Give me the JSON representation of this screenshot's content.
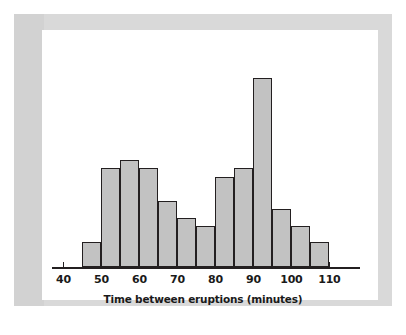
{
  "figure": {
    "background_color": "#ffffff",
    "mat_color": "#d9d9d9",
    "panel_color": "#ffffff",
    "bar_fill_color": "#c2c2c2",
    "bar_edge_color": "#231f20",
    "axis_color": "#231f20"
  },
  "chart_data": {
    "type": "bar",
    "title": "",
    "subtitle": "",
    "xlabel": "Time between eruptions (minutes)",
    "ylabel": "",
    "grid": false,
    "legend": null,
    "legend_position": "none",
    "bin_width": 5,
    "xlim": [
      37,
      118
    ],
    "ylim": [
      0,
      28
    ],
    "xticks": [
      40,
      50,
      60,
      70,
      80,
      90,
      100,
      110
    ],
    "xtick_labels": [
      "40",
      "50",
      "60",
      "70",
      "80",
      "90",
      "100",
      "110"
    ],
    "yticks": [],
    "ytick_labels": [],
    "bin_edges": [
      45,
      50,
      55,
      60,
      65,
      70,
      75,
      80,
      85,
      90,
      95,
      100,
      105,
      110
    ],
    "categories": [
      "45-50",
      "50-55",
      "55-60",
      "60-65",
      "65-70",
      "70-75",
      "75-80",
      "80-85",
      "85-90",
      "90-95",
      "95-100",
      "100-105",
      "105-110"
    ],
    "values": [
      3,
      12,
      13,
      12,
      8,
      6,
      5,
      11,
      12,
      23,
      7,
      5,
      3
    ],
    "annotations": []
  }
}
